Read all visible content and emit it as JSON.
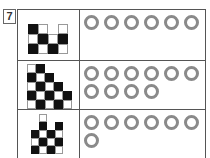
{
  "question_number": "7",
  "rows": [
    {
      "pattern": [
        [
          "b",
          "w",
          "e",
          "w"
        ],
        [
          "w",
          "b",
          "w",
          "b"
        ],
        [
          "b",
          "w",
          "b",
          "w"
        ]
      ],
      "cell_size": 10,
      "circle_count": 6
    },
    {
      "pattern": [
        [
          "w",
          "b",
          "e",
          "e",
          "e"
        ],
        [
          "b",
          "w",
          "b",
          "e",
          "e"
        ],
        [
          "w",
          "b",
          "w",
          "b",
          "e"
        ],
        [
          "b",
          "w",
          "b",
          "w",
          "b"
        ],
        [
          "w",
          "b",
          "w",
          "b",
          "w"
        ]
      ],
      "cell_size": 9,
      "circle_count": 10
    },
    {
      "pattern": [
        [
          "e",
          "w",
          "e",
          "e"
        ],
        [
          "e",
          "b",
          "e",
          "b"
        ],
        [
          "b",
          "w",
          "b",
          "w"
        ],
        [
          "w",
          "b",
          "w",
          "b"
        ],
        [
          "b",
          "w",
          "b",
          "w"
        ]
      ],
      "cell_size": 8,
      "circle_count": 7
    }
  ],
  "colors": {
    "black_cell": "#111111",
    "circle_stroke": "#8a8a8a",
    "border": "#555555"
  }
}
